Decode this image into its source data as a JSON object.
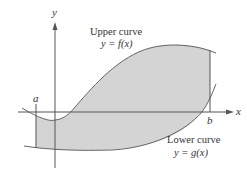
{
  "figure": {
    "axes": {
      "x_label": "x",
      "y_label": "y"
    },
    "bounds": {
      "left_label": "a",
      "right_label": "b"
    },
    "upper_curve": {
      "title": "Upper curve",
      "equation": "y = f(x)"
    },
    "lower_curve": {
      "title": "Lower curve",
      "equation": "y = g(x)"
    },
    "colors": {
      "shade": "#d4d4d4",
      "line": "#555555",
      "text": "#333333"
    }
  }
}
